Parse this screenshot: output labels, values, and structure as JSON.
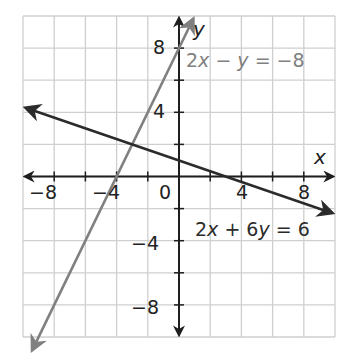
{
  "chart_data": {
    "type": "line",
    "title": "",
    "xlabel": "x",
    "ylabel": "y",
    "xlim": [
      -10,
      10
    ],
    "ylim": [
      -10,
      10
    ],
    "grid": true,
    "grid_step": 2,
    "x_ticks": [
      -8,
      -4,
      0,
      4,
      8
    ],
    "y_ticks": [
      -8,
      -4,
      4,
      8
    ],
    "tick_labels": {
      "x": [
        "−8",
        "−4",
        "0",
        "4",
        "8"
      ],
      "y": [
        "8",
        "4",
        "−4",
        "−8"
      ]
    },
    "series": [
      {
        "name": "2x − y = −8",
        "equation": "y = 2x + 8",
        "color": "#808080",
        "x": [
          -9.4,
          0.9
        ],
        "y": [
          -10.8,
          9.8
        ],
        "arrows": "both"
      },
      {
        "name": "2x + 6y = 6",
        "equation": "y = 1 − x/3",
        "color": "#2b2b2b",
        "x": [
          -9.8,
          9.8
        ],
        "y": [
          4.27,
          -2.27
        ],
        "arrows": "both"
      }
    ],
    "annotations": [
      {
        "text": "2x − y = −8",
        "x": 1,
        "y": 7.6,
        "color": "#808080"
      },
      {
        "text": "2x + 6y = 6",
        "x": 2,
        "y": -3.4,
        "color": "#2b2b2b"
      }
    ],
    "intersection": {
      "x": -3,
      "y": 2
    }
  },
  "labels": {
    "x_axis": "x",
    "y_axis": "y",
    "eq1": {
      "a": "2",
      "v1": "x",
      "op": " − ",
      "v2": "y",
      "rhs": " = −8"
    },
    "eq2": {
      "a": "2",
      "v1": "x",
      "op": " + 6",
      "v2": "y",
      "rhs": " = 6"
    },
    "ticks": {
      "xm8": "−8",
      "xm4": "−4",
      "x0": "0",
      "x4": "4",
      "x8": "8",
      "y8": "8",
      "y4": "4",
      "ym4": "−4",
      "ym8": "−8"
    }
  },
  "colors": {
    "grid": "#cfcfcf",
    "axis": "#1e1e1e",
    "line1": "#808080",
    "line2": "#2b2b2b"
  }
}
